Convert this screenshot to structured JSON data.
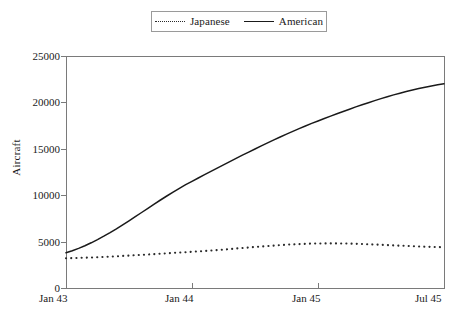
{
  "chart_data": {
    "type": "line",
    "title": "",
    "xlabel": "",
    "ylabel": "Aircraft",
    "x": [
      "Jan 43",
      "Jan 44",
      "Jan 45",
      "Jul 45"
    ],
    "xticklabels": [
      "Jan 43",
      "Jan 44",
      "Jan 45",
      "Jul 45"
    ],
    "yticklabels": [
      "0",
      "5000",
      "10000",
      "15000",
      "20000",
      "25000"
    ],
    "yticks": [
      0,
      5000,
      10000,
      15000,
      20000,
      25000
    ],
    "ylim": [
      0,
      25000
    ],
    "xlim": [
      0,
      30
    ],
    "grid": false,
    "legend_position": "top-center",
    "series": [
      {
        "name": "Japanese",
        "style": "dotted",
        "color": "#2a2a2a",
        "categories": [
          "Jan 43",
          "Jan 44",
          "Jan 45",
          "Jul 45"
        ],
        "values": [
          3200,
          3900,
          4800,
          4400
        ]
      },
      {
        "name": "American",
        "style": "solid",
        "color": "#1a1a1a",
        "categories": [
          "Jan 43",
          "Jan 44",
          "Jan 45",
          "Jul 45"
        ],
        "values": [
          3800,
          11500,
          18000,
          22000
        ]
      }
    ]
  },
  "legend": {
    "japanese_label": "Japanese",
    "american_label": "American"
  },
  "axes": {
    "y_label": "Aircraft",
    "y_ticks": [
      "25000",
      "20000",
      "15000",
      "10000",
      "5000",
      "0"
    ],
    "x_ticks": [
      "Jan 43",
      "Jan 44",
      "Jan 45",
      "Jul 45"
    ]
  }
}
